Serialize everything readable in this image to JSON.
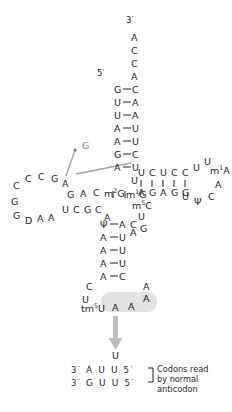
{
  "figure": {
    "type": "trna-cloverleaf-diagram",
    "colors": {
      "text": "#231f20",
      "green_accent": "#7f9a7a",
      "arrow_gray": "#b0b0b0",
      "highlight": "#dddddd",
      "background": "#ffffff"
    }
  },
  "labels": {
    "three_prime_top": "3′",
    "five_prime_top": "5′",
    "mutation_callout": "G"
  },
  "acceptor_stem": {
    "three_prime_tail": [
      "A",
      "C",
      "C",
      "A"
    ],
    "pairs": [
      {
        "left": "G",
        "right": "C"
      },
      {
        "left": "U",
        "right": "A"
      },
      {
        "left": "U",
        "right": "A"
      },
      {
        "left": "A",
        "right": "U"
      },
      {
        "left": "A",
        "right": "U"
      },
      {
        "left": "G",
        "right": "C"
      },
      {
        "left": "A",
        "right": "U"
      }
    ]
  },
  "junction_5p": {
    "bases": [
      "U",
      "m1G"
    ],
    "modified": [
      "m1G"
    ]
  },
  "d_arm": {
    "loop_upper_arc": [
      "C",
      "C",
      "C",
      "G",
      "A"
    ],
    "loop_lower_arc": [
      "G",
      "G",
      "D",
      "A",
      "A"
    ],
    "loop_inner": [
      "G"
    ],
    "stem_top": [
      "A",
      "C",
      "m2G"
    ],
    "stem_bottom": [
      "U",
      "C",
      "G",
      "C"
    ],
    "after_stem": [
      "A"
    ],
    "modified": [
      "m2G",
      "D"
    ]
  },
  "t_arm": {
    "stem_top": [
      "U",
      "C",
      "U",
      "C",
      "C"
    ],
    "stem_bottom": [
      "A",
      "G",
      "A",
      "G",
      "G"
    ],
    "loop": [
      "U",
      "U",
      "m1A",
      "A",
      "C",
      "Ψ",
      "U"
    ],
    "modified": [
      "m1A",
      "Ψ"
    ]
  },
  "variable_loop": {
    "bases": [
      "m5C",
      "U",
      "G",
      "A"
    ],
    "modified": [
      "m5C"
    ]
  },
  "anticodon_arm": {
    "pairs": [
      {
        "left": "Ψ",
        "right": "A"
      },
      {
        "left": "A",
        "right": "U"
      },
      {
        "left": "A",
        "right": "U"
      },
      {
        "left": "A",
        "right": "U"
      },
      {
        "left": "A",
        "right": "C"
      }
    ],
    "stem_extra": [
      "C",
      "A"
    ],
    "loop_left": [
      "C",
      "U"
    ],
    "loop_right": [
      "A",
      "A"
    ],
    "anticodon": [
      "tm5U",
      "A",
      "A"
    ],
    "anticodon_highlighted": true,
    "wobble_base": "tm5U"
  },
  "arrow_product": {
    "base": "U"
  },
  "codon_box": {
    "rows": [
      {
        "left_prime": "3′",
        "bases": [
          "A",
          "U",
          "U"
        ],
        "right_prime": "5′"
      },
      {
        "left_prime": "3′",
        "bases": [
          "G",
          "U",
          "U"
        ],
        "right_prime": "5′"
      }
    ],
    "caption_lines": [
      "Codons read",
      "by normal",
      "anticodon"
    ]
  }
}
